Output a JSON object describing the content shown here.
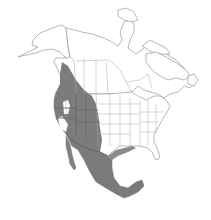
{
  "map": {
    "region": "North America",
    "type": "species-range-map",
    "legend": [],
    "colors": {
      "background": "#ffffff",
      "land": "#ffffff",
      "outline": "#9a9a9a",
      "range_fill": "#7c7c7c",
      "range_border": "#4a4a4a"
    },
    "range_description": "Shaded range covering western North America from interior British Columbia and Alberta south through the Great Basin, Rocky Mountain and southwestern US states, and nearly all of Mexico including Baja California"
  }
}
